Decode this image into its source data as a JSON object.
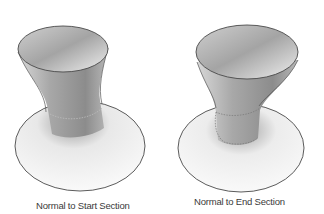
{
  "figure": {
    "panels": [
      {
        "id": "left",
        "caption": "Normal to Start Section",
        "shape": "lofted-flared-surface"
      },
      {
        "id": "right",
        "caption": "Normal to End Section",
        "shape": "lofted-flared-surface"
      }
    ],
    "colors": {
      "background": "#ffffff",
      "outline": "#4a4a4a",
      "shade_dark": "#8a8a8a",
      "shade_light": "#f4f4f4",
      "caption": "#3a3a3a"
    }
  }
}
